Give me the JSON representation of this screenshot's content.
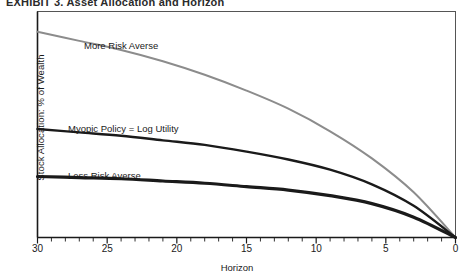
{
  "figure": {
    "clipped_caption": "EXHIBIT 3.  Asset Allocation and Horizon",
    "xlabel": "Horizon",
    "ylabel": "Stock Allocation: % of Wealth",
    "frame_color": "#555555",
    "axis_color": "#1a1a1a"
  },
  "chart_data": {
    "type": "line",
    "title": "",
    "xlabel": "Horizon",
    "ylabel": "Stock Allocation: % of Wealth",
    "xlim": [
      30,
      0
    ],
    "x_reversed": true,
    "ylim": [
      0,
      100
    ],
    "grid": false,
    "legend": "inline-labels",
    "xticks_major": [
      30,
      25,
      20,
      15,
      10,
      5,
      0
    ],
    "xtick_labels": [
      "30",
      "25",
      "20",
      "15",
      "10",
      "5",
      "0"
    ],
    "xticks_minor_step": 1,
    "yticks": [],
    "ytick_labels": [],
    "x": [
      30,
      27,
      24,
      21,
      18,
      15,
      12,
      9,
      6,
      3,
      0
    ],
    "series": [
      {
        "name": "More Risk Averse",
        "color": "#8c8c8c",
        "width": 2.0,
        "values": [
          91,
          87,
          83,
          78,
          72,
          65,
          57,
          47,
          35,
          20,
          0
        ]
      },
      {
        "name": "Myopic Policy = Log Utility",
        "color": "#1a1a1a",
        "width": 2.4,
        "values": [
          48,
          46.5,
          45,
          43,
          41,
          38,
          34.5,
          30,
          23.5,
          14,
          0
        ]
      },
      {
        "name": "Less Risk Averse",
        "color": "#1a1a1a",
        "width": 3.2,
        "values": [
          27,
          26.5,
          26,
          25,
          24,
          22.5,
          21,
          18.5,
          15,
          9,
          0
        ]
      }
    ],
    "annotations": [
      {
        "text": "More Risk Averse",
        "x_px": 84,
        "y_px": 40
      },
      {
        "text": "Myopic Policy = Log Utility",
        "x_px": 68,
        "y_px": 123
      },
      {
        "text": "Less Risk Averse",
        "x_px": 68,
        "y_px": 170
      }
    ]
  }
}
